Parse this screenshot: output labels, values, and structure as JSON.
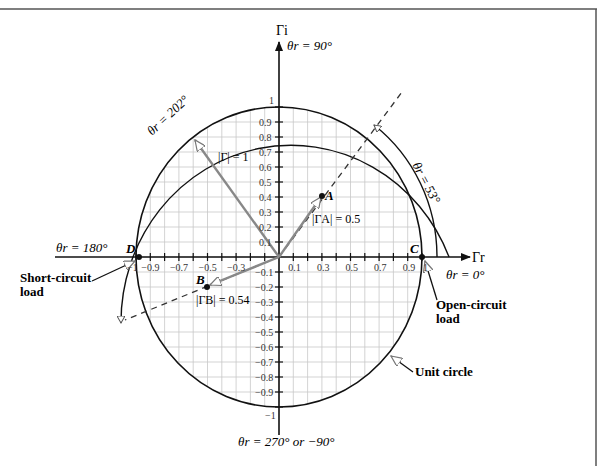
{
  "figure": {
    "axes": {
      "real_axis_label": "Γr",
      "imag_axis_label": "Γi",
      "angle_0": "θr = 0°",
      "angle_90": "θr = 90°",
      "angle_180": "θr = 180°",
      "angle_270": "θr = 270° or −90°"
    },
    "x_ticks": [
      "−1",
      "−0.9",
      "−0.7",
      "−0.5",
      "−0.3",
      "0.1",
      "0.3",
      "0.5",
      "0.7",
      "0.9",
      "1"
    ],
    "y_ticks_pos": [
      "1",
      "0.9",
      "0.8",
      "0.7",
      "0.6",
      "0.5",
      "0.4",
      "0.3",
      "0.2",
      "0.1"
    ],
    "y_ticks_neg": [
      "−0.1",
      "−0.2",
      "−0.3",
      "−0.4",
      "−0.5",
      "−0.6",
      "−0.7",
      "−0.8",
      "−0.9",
      "−1"
    ],
    "points": {
      "A": {
        "label": "A",
        "magnitude_label": "|ΓA| = 0.5",
        "x": 0.3,
        "y": 0.4
      },
      "B": {
        "label": "B",
        "magnitude_label": "|ΓB| = 0.54",
        "x": -0.5,
        "y": -0.2
      },
      "C": {
        "label": "C",
        "x": 1,
        "y": 0
      },
      "D": {
        "label": "D",
        "x": -1,
        "y": 0
      }
    },
    "vectors": {
      "unit_vector_label": "|Γ| = 1"
    },
    "arcs": {
      "arc_53": "θr = 53°",
      "arc_202": "θr = 202°"
    },
    "annotations": {
      "short_circuit": [
        "Short-circuit",
        "load"
      ],
      "open_circuit": [
        "Open-circuit",
        "load"
      ],
      "unit_circle": "Unit circle"
    }
  }
}
